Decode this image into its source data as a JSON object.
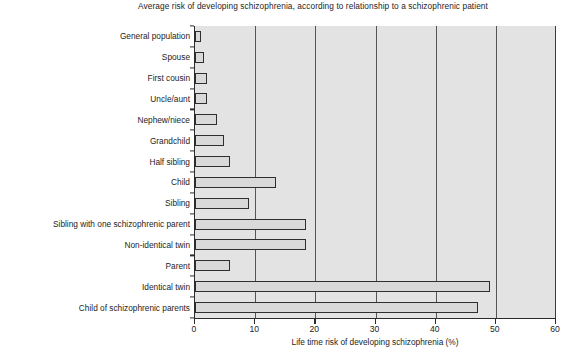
{
  "chart_data": {
    "type": "bar",
    "orientation": "horizontal",
    "title": "Average risk of developing schizophrenia, according to relationship to a schizophrenic patient",
    "xlabel": "Life time risk of developing schizophrenia (%)",
    "ylabel": "",
    "xlim": [
      0,
      60
    ],
    "xticks": [
      0,
      10,
      20,
      30,
      40,
      50,
      60
    ],
    "xtick_labels": [
      "0",
      "10",
      "20",
      "30",
      "40",
      "50",
      "60"
    ],
    "grid": true,
    "grid_axis": "x",
    "legend": null,
    "categories": [
      "General population",
      "Spouse",
      "First cousin",
      "Uncle/aunt",
      "Nephew/niece",
      "Grandchild",
      "Half sibling",
      "Child",
      "Sibling",
      "Sibling with one schizophrenic parent",
      "Non-identical twin",
      "Parent",
      "Identical twin",
      "Child of schizophrenic parents"
    ],
    "values": [
      1,
      1.5,
      2,
      2,
      3.6,
      4.8,
      5.8,
      13.5,
      9,
      18.5,
      18.5,
      5.8,
      49,
      47
    ],
    "colors": {
      "bar_fill": "#d9d9d9",
      "bar_border": "#2e2e2e",
      "plot_background": "#e3e3e3",
      "gridline": "#555555",
      "axis": "#2b2b2b",
      "text": "#1d1d1d"
    }
  },
  "caption_fragment": ""
}
